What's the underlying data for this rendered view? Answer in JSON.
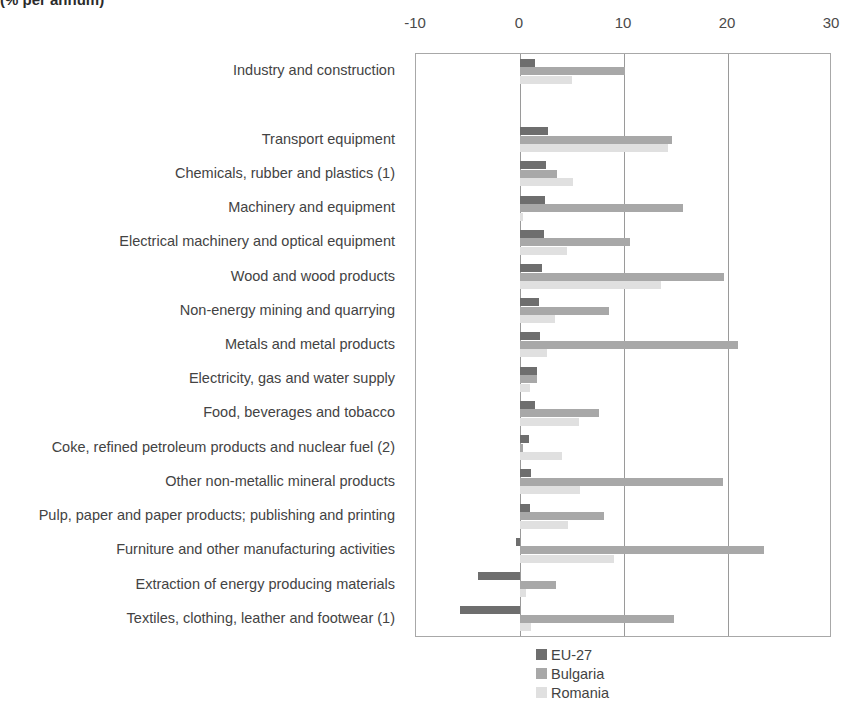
{
  "chart_subtitle": "(% per annum)",
  "chart_data": {
    "type": "bar",
    "orientation": "horizontal",
    "title": "(% per annum)",
    "xlabel": "",
    "ylabel": "",
    "xlim": [
      -10,
      30
    ],
    "xticks": [
      -10,
      0,
      10,
      20,
      30
    ],
    "xtick_labels": [
      "-10",
      "0",
      "10",
      "20",
      "30"
    ],
    "grid": true,
    "legend_position": "bottom-center",
    "categories": [
      "Industry and construction",
      "",
      "Transport equipment",
      "Chemicals, rubber and plastics (1)",
      "Machinery and equipment",
      "Electrical machinery and optical equipment",
      "Wood and wood products",
      "Non-energy mining and quarrying",
      "Metals and metal products",
      "Electricity, gas and water supply",
      "Food, beverages and tobacco",
      "Coke, refined petroleum products and nuclear fuel (2)",
      "Other non-metallic mineral products",
      "Pulp, paper and paper products; publishing and printing",
      "Furniture and other manufacturing activities",
      "Extraction of energy producing materials",
      "Textiles, clothing, leather and footwear (1)"
    ],
    "series": [
      {
        "name": "EU-27",
        "color": "#6e6e6e",
        "values": [
          1.4,
          null,
          2.7,
          2.5,
          2.4,
          2.3,
          2.1,
          1.8,
          1.9,
          1.6,
          1.4,
          0.9,
          1.1,
          1.0,
          -0.4,
          -4.0,
          -5.8
        ]
      },
      {
        "name": "Bulgaria",
        "color": "#a8a8a8",
        "values": [
          10.1,
          null,
          14.6,
          3.6,
          15.7,
          10.6,
          19.6,
          8.6,
          21.0,
          1.6,
          7.6,
          0.3,
          19.5,
          8.1,
          23.5,
          3.5,
          14.8
        ]
      },
      {
        "name": "Romania",
        "color": "#e0e0e0",
        "values": [
          5.0,
          null,
          14.2,
          5.1,
          0.3,
          4.5,
          13.6,
          3.4,
          2.6,
          1.0,
          5.7,
          4.0,
          5.8,
          4.6,
          9.0,
          0.6,
          1.1
        ]
      }
    ]
  },
  "legend": {
    "items": [
      {
        "label": "EU-27",
        "color": "#6e6e6e"
      },
      {
        "label": "Bulgaria",
        "color": "#a8a8a8"
      },
      {
        "label": "Romania",
        "color": "#e0e0e0"
      }
    ]
  }
}
